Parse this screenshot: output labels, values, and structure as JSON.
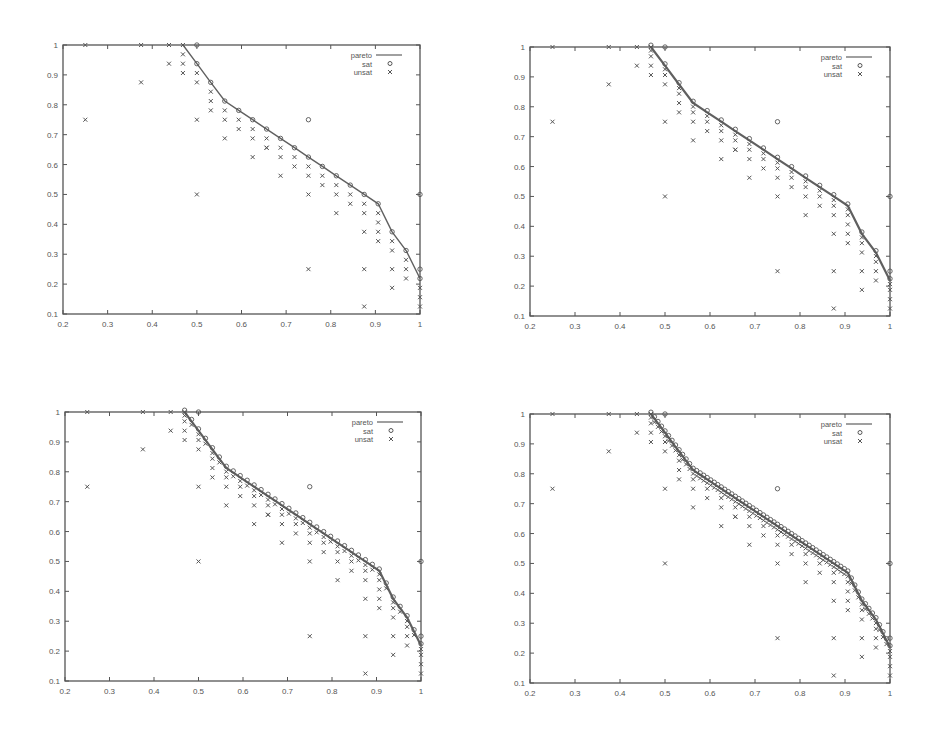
{
  "figure": {
    "background": "#ffffff",
    "ink_color": "#555555",
    "line_color": "#606060"
  },
  "legend": {
    "entries": [
      {
        "label": "pareto",
        "symbol": "line"
      },
      {
        "label": "sat",
        "symbol": "circle"
      },
      {
        "label": "unsat",
        "symbol": "cross"
      }
    ]
  },
  "chart_data": [
    {
      "id": "top-left",
      "type": "scatter",
      "title": "",
      "xlabel": "",
      "ylabel": "",
      "xlim": [
        0.2,
        1
      ],
      "ylim": [
        0.1,
        1
      ],
      "xticks": [
        "0.2",
        "0.3",
        "0.4",
        "0.5",
        "0.6",
        "0.7",
        "0.8",
        "0.9",
        "1"
      ],
      "yticks": [
        "0.1",
        "0.2",
        "0.3",
        "0.4",
        "0.5",
        "0.6",
        "0.7",
        "0.8",
        "0.9",
        "1"
      ],
      "legend_position": "top-right",
      "grid": false,
      "frame": {
        "x": 63,
        "y": 45,
        "w": 357,
        "h": 269
      },
      "resolution": 8,
      "series": [
        {
          "name": "pareto",
          "style": "line",
          "x": [
            0.469,
            0.5,
            0.531,
            0.5625,
            0.59375,
            0.625,
            0.65625,
            0.6875,
            0.71875,
            0.75,
            0.78125,
            0.8125,
            0.84375,
            0.875,
            0.90625,
            0.9375,
            0.96875,
            1.0
          ],
          "y": [
            1.0,
            0.9375,
            0.875,
            0.8125,
            0.78125,
            0.75,
            0.71875,
            0.6875,
            0.65625,
            0.625,
            0.59375,
            0.5625,
            0.53125,
            0.5,
            0.46875,
            0.375,
            0.3125,
            0.21875
          ]
        },
        {
          "name": "sat",
          "style": "circle",
          "x": [
            0.5,
            0.5,
            0.531,
            0.5625,
            0.59375,
            0.625,
            0.65625,
            0.6875,
            0.71875,
            0.75,
            0.78125,
            0.8125,
            0.84375,
            0.875,
            0.90625,
            0.9375,
            0.96875,
            1.0,
            1.0,
            1.0,
            0.75
          ],
          "y": [
            1.0,
            0.9375,
            0.875,
            0.8125,
            0.78125,
            0.75,
            0.71875,
            0.6875,
            0.65625,
            0.625,
            0.59375,
            0.5625,
            0.53125,
            0.5,
            0.46875,
            0.375,
            0.3125,
            0.5,
            0.25,
            0.21875,
            0.75
          ]
        },
        {
          "name": "unsat",
          "style": "cross",
          "x": [
            0.25,
            0.375,
            0.4375,
            0.46875,
            0.25,
            0.375,
            0.4375,
            0.46875,
            0.46875,
            0.46875,
            0.5,
            0.5,
            0.5,
            0.5,
            0.53125,
            0.53125,
            0.53125,
            0.5625,
            0.5625,
            0.5625,
            0.59375,
            0.59375,
            0.625,
            0.625,
            0.625,
            0.65625,
            0.65625,
            0.65625,
            0.6875,
            0.6875,
            0.6875,
            0.71875,
            0.71875,
            0.75,
            0.75,
            0.75,
            0.75,
            0.78125,
            0.78125,
            0.8125,
            0.8125,
            0.8125,
            0.84375,
            0.84375,
            0.875,
            0.875,
            0.875,
            0.875,
            0.875,
            0.90625,
            0.90625,
            0.90625,
            0.90625,
            0.9375,
            0.9375,
            0.9375,
            0.9375,
            0.96875,
            0.96875,
            0.96875,
            1.0,
            1.0,
            1.0
          ],
          "y": [
            1.0,
            1.0,
            1.0,
            1.0,
            0.75,
            0.875,
            0.9375,
            0.96875,
            0.9375,
            0.90625,
            0.90625,
            0.875,
            0.75,
            0.5,
            0.84375,
            0.8125,
            0.78125,
            0.78125,
            0.75,
            0.6875,
            0.75,
            0.71875,
            0.71875,
            0.6875,
            0.625,
            0.6875,
            0.65625,
            0.65625,
            0.65625,
            0.625,
            0.5625,
            0.625,
            0.59375,
            0.59375,
            0.5625,
            0.5,
            0.25,
            0.5625,
            0.53125,
            0.53125,
            0.5,
            0.4375,
            0.5,
            0.46875,
            0.46875,
            0.4375,
            0.375,
            0.25,
            0.125,
            0.4375,
            0.40625,
            0.375,
            0.34375,
            0.34375,
            0.3125,
            0.25,
            0.1875,
            0.28125,
            0.25,
            0.21875,
            0.1875,
            0.15625,
            0.125
          ]
        }
      ]
    },
    {
      "id": "top-right",
      "type": "scatter",
      "title": "",
      "xlabel": "",
      "ylabel": "",
      "xlim": [
        0.2,
        1
      ],
      "ylim": [
        0.1,
        1
      ],
      "xticks": [
        "0.2",
        "0.3",
        "0.4",
        "0.5",
        "0.6",
        "0.7",
        "0.8",
        "0.9",
        "1"
      ],
      "yticks": [
        "0.1",
        "0.2",
        "0.3",
        "0.4",
        "0.5",
        "0.6",
        "0.7",
        "0.8",
        "0.9",
        "1"
      ],
      "legend_position": "top-right",
      "grid": false,
      "frame": {
        "x": 530,
        "y": 47,
        "w": 360,
        "h": 269
      },
      "resolution": 16
    },
    {
      "id": "bottom-left",
      "type": "scatter",
      "title": "",
      "xlabel": "",
      "ylabel": "",
      "xlim": [
        0.2,
        1
      ],
      "ylim": [
        0.1,
        1
      ],
      "xticks": [
        "0.2",
        "0.3",
        "0.4",
        "0.5",
        "0.6",
        "0.7",
        "0.8",
        "0.9",
        "1"
      ],
      "yticks": [
        "0.1",
        "0.2",
        "0.3",
        "0.4",
        "0.5",
        "0.6",
        "0.7",
        "0.8",
        "0.9",
        "1"
      ],
      "legend_position": "top-right",
      "grid": false,
      "frame": {
        "x": 65,
        "y": 412,
        "w": 356,
        "h": 269
      },
      "resolution": 32
    },
    {
      "id": "bottom-right",
      "type": "scatter",
      "title": "",
      "xlabel": "",
      "ylabel": "",
      "xlim": [
        0.2,
        1
      ],
      "ylim": [
        0.1,
        1
      ],
      "xticks": [
        "0.2",
        "0.3",
        "0.4",
        "0.5",
        "0.6",
        "0.7",
        "0.8",
        "0.9",
        "1"
      ],
      "yticks": [
        "0.1",
        "0.2",
        "0.3",
        "0.4",
        "0.5",
        "0.6",
        "0.7",
        "0.8",
        "0.9",
        "1"
      ],
      "legend_position": "top-right",
      "grid": false,
      "frame": {
        "x": 530,
        "y": 414,
        "w": 360,
        "h": 269
      },
      "resolution": 64
    }
  ]
}
